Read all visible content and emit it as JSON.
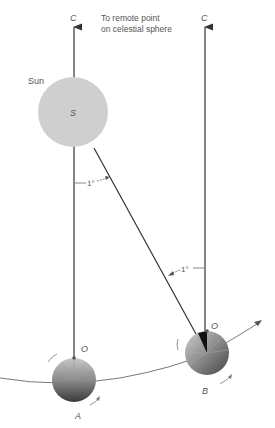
{
  "figure": {
    "labels": {
      "c_left": "C",
      "c_right": "C",
      "remote_line1": "To remote point",
      "remote_line2": "on celestial sphere",
      "sun": "Sun",
      "sun_center": "S",
      "angle_top": "1°",
      "angle_bottom": "1°",
      "o_left": "O",
      "o_right": "O",
      "earth_a": "A",
      "earth_b": "B"
    },
    "colors": {
      "sun_fill": "#cfcfcf",
      "line": "#333333",
      "text": "#555555"
    }
  }
}
